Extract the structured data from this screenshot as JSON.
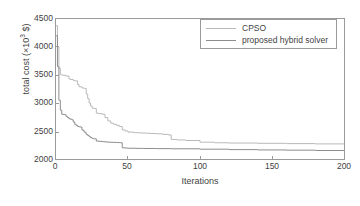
{
  "chart_data": {
    "type": "line",
    "title": "",
    "xlabel": "Iterations",
    "ylabel": "total cost (×10³ $)",
    "ylabel_base": "total cost (×10",
    "ylabel_exp": "3",
    "ylabel_tail": " $)",
    "xlim": [
      0,
      200
    ],
    "ylim": [
      2000,
      4500
    ],
    "xticks": [
      0,
      50,
      100,
      150,
      200
    ],
    "yticks": [
      2000,
      2500,
      3000,
      3500,
      4000,
      4500
    ],
    "xtick_labels": [
      "0",
      "50",
      "100",
      "150",
      "200"
    ],
    "ytick_labels": [
      "2000",
      "2500",
      "3000",
      "3500",
      "4000",
      "4500"
    ],
    "grid": false,
    "legend_position": "top-right",
    "series": [
      {
        "name": "CPSO",
        "color": "#b9b9b9",
        "linewidth": 1,
        "x": [
          0,
          1,
          2,
          3,
          4,
          5,
          7,
          9,
          10,
          12,
          13,
          15,
          16,
          18,
          19,
          20,
          21,
          22,
          23,
          24,
          25,
          26,
          27,
          28,
          29,
          30,
          32,
          34,
          36,
          38,
          40,
          42,
          44,
          46,
          48,
          50,
          54,
          58,
          62,
          66,
          70,
          74,
          78,
          80,
          84,
          90,
          100,
          110,
          120,
          140,
          160,
          180,
          200
        ],
        "values": [
          4380,
          4000,
          3620,
          3505,
          3500,
          3495,
          3480,
          3430,
          3420,
          3400,
          3395,
          3330,
          3290,
          3270,
          3265,
          3260,
          3160,
          3080,
          3000,
          2950,
          2910,
          2905,
          2900,
          2820,
          2815,
          2810,
          2800,
          2740,
          2680,
          2640,
          2620,
          2600,
          2580,
          2520,
          2500,
          2480,
          2470,
          2465,
          2460,
          2455,
          2450,
          2440,
          2430,
          2350,
          2340,
          2330,
          2300,
          2290,
          2285,
          2280,
          2275,
          2270,
          2265
        ]
      },
      {
        "name": "proposed hybrid solver",
        "color": "#8d8d8d",
        "linewidth": 1,
        "x": [
          0,
          1,
          2,
          3,
          4,
          5,
          6,
          7,
          8,
          9,
          10,
          11,
          12,
          13,
          14,
          15,
          16,
          17,
          18,
          19,
          20,
          21,
          22,
          23,
          24,
          25,
          26,
          28,
          30,
          32,
          34,
          36,
          38,
          40,
          42,
          44,
          45,
          46,
          48,
          50,
          55,
          60,
          70,
          80,
          100,
          120,
          140,
          160,
          180,
          200
        ],
        "values": [
          4200,
          3650,
          3050,
          2870,
          2800,
          2795,
          2790,
          2760,
          2740,
          2720,
          2710,
          2700,
          2660,
          2620,
          2600,
          2580,
          2575,
          2570,
          2520,
          2500,
          2470,
          2440,
          2420,
          2400,
          2380,
          2370,
          2360,
          2320,
          2315,
          2310,
          2305,
          2300,
          2298,
          2296,
          2294,
          2292,
          2290,
          2200,
          2195,
          2192,
          2190,
          2188,
          2185,
          2182,
          2175,
          2168,
          2162,
          2158,
          2152,
          2148
        ]
      }
    ]
  },
  "colors": {
    "axis": "#9a9a9a",
    "text": "#3f3f3f",
    "background": "#ffffff",
    "series_cpso": "#b9b9b9",
    "series_hybrid": "#8d8d8d"
  }
}
